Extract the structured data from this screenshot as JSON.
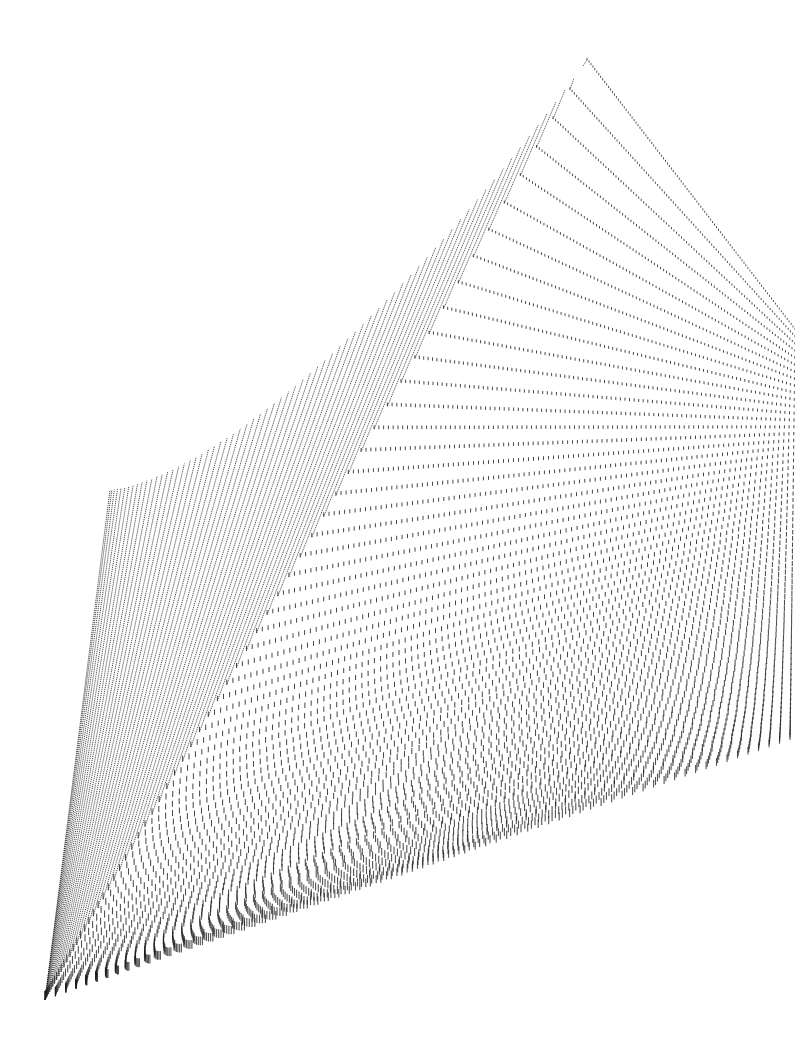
{
  "image": {
    "description": "Perspective artwork of thousands of tiny human figures arranged in nested L-shaped rows forming a pyramid that converges to a peak at the top",
    "width": 795,
    "height": 1041,
    "background": "#ffffff",
    "ink_color": "#1a1a1a"
  },
  "composition": {
    "apex": [
      587,
      60
    ],
    "outer_corner": [
      45,
      1000
    ],
    "outer_left_arm_top": [
      110,
      490
    ],
    "right_edge_top": [
      795,
      330
    ],
    "outer_right_arm_end": [
      790,
      740
    ],
    "row_count": 70,
    "spacing_exponent": 2.2
  }
}
